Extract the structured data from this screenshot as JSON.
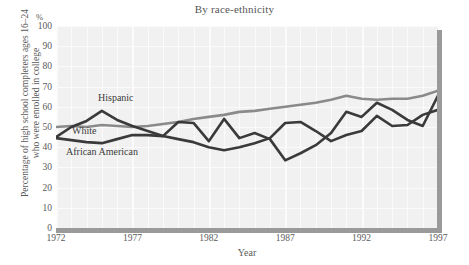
{
  "chart_data": {
    "type": "line",
    "title": "By race-ethnicity",
    "xlabel": "Year",
    "ylabel": "Percentage of high school completers ages 16–24 who were enrolled in college",
    "yunit": "%",
    "xlim": [
      1972,
      1997
    ],
    "ylim": [
      0,
      100
    ],
    "ytick_labels": [
      "0",
      "10",
      "20",
      "30",
      "40",
      "50",
      "60",
      "70",
      "80",
      "90",
      "100"
    ],
    "ytick_values": [
      0,
      10,
      20,
      30,
      40,
      50,
      60,
      70,
      80,
      90,
      100
    ],
    "xtick_labels": [
      "1972",
      "1977",
      "1982",
      "1987",
      "1992",
      "1997"
    ],
    "xtick_values": [
      1972,
      1977,
      1982,
      1987,
      1992,
      1997
    ],
    "grid": true,
    "legend_position": "inline-labels",
    "x": [
      1972,
      1973,
      1974,
      1975,
      1976,
      1977,
      1978,
      1979,
      1980,
      1981,
      1982,
      1983,
      1984,
      1985,
      1986,
      1987,
      1988,
      1989,
      1990,
      1991,
      1992,
      1993,
      1994,
      1995,
      1996,
      1997
    ],
    "series": [
      {
        "name": "White",
        "color": "#8a8a8a",
        "values": [
          50.0,
          50.5,
          50.0,
          51.0,
          50.5,
          50.0,
          50.5,
          51.5,
          52.5,
          54.0,
          55.0,
          56.0,
          57.5,
          58.0,
          59.0,
          60.0,
          61.0,
          62.0,
          63.5,
          65.5,
          64.0,
          63.5,
          64.0,
          64.0,
          65.5,
          68.0
        ]
      },
      {
        "name": "African American",
        "color": "#3a3a3a",
        "values": [
          44.5,
          43.5,
          42.5,
          42.0,
          44.0,
          46.0,
          46.0,
          45.5,
          44.0,
          42.5,
          40.0,
          38.5,
          40.0,
          42.0,
          44.5,
          52.0,
          52.5,
          48.0,
          43.0,
          46.0,
          48.0,
          55.5,
          50.5,
          51.0,
          56.0,
          58.5
        ]
      },
      {
        "name": "Hispanic",
        "color": "#3a3a3a",
        "values": [
          45.0,
          50.0,
          53.0,
          58.0,
          53.5,
          50.5,
          48.0,
          45.5,
          52.5,
          52.0,
          43.0,
          54.0,
          44.5,
          47.0,
          44.0,
          33.5,
          37.0,
          41.0,
          47.0,
          57.5,
          55.0,
          62.0,
          58.5,
          53.5,
          50.5,
          65.5
        ]
      }
    ],
    "annotations": [
      {
        "text": "Hispanic"
      },
      {
        "text": "White"
      },
      {
        "text": "African American"
      }
    ]
  },
  "style": {
    "plot_background": "#f1f1f1",
    "gridline_color": "#fbfbfb",
    "axis_bar_color": "#9a9a9a",
    "text_color": "#5a5a5a"
  }
}
